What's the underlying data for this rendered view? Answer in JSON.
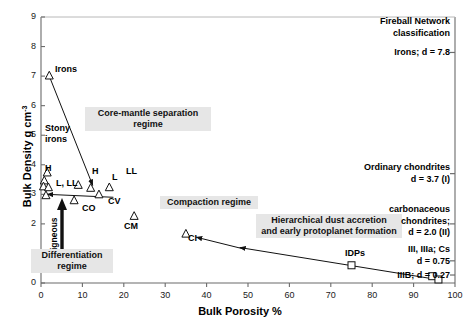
{
  "chart_data": {
    "type": "scatter",
    "title": "",
    "xlabel": "Bulk Porosity %",
    "ylabel": "Bulk Density g cm⁻³",
    "xlim": [
      0,
      100
    ],
    "ylim": [
      0,
      9
    ],
    "xticks": [
      0,
      10,
      20,
      30,
      40,
      50,
      60,
      70,
      80,
      90,
      100
    ],
    "yticks": [
      0,
      1,
      2,
      3,
      4,
      5,
      6,
      7,
      8,
      9
    ],
    "grid": false,
    "legend": "none",
    "series": [
      {
        "name": "Meteorite groups",
        "marker": "open-triangle",
        "points": [
          {
            "label": "Irons",
            "x": 2.0,
            "y": 7.0
          },
          {
            "label": "H",
            "x": 1.5,
            "y": 3.72
          },
          {
            "label": "",
            "x": 0.8,
            "y": 3.45
          },
          {
            "label": "L, LL",
            "x": 0.6,
            "y": 3.25
          },
          {
            "label": "",
            "x": 1.8,
            "y": 3.22
          },
          {
            "label": "H",
            "x": 9.0,
            "y": 3.3
          },
          {
            "label": "L",
            "x": 12.0,
            "y": 3.2
          },
          {
            "label": "LL",
            "x": 16.5,
            "y": 3.22
          },
          {
            "label": "",
            "x": 1.2,
            "y": 2.95
          },
          {
            "label": "CO",
            "x": 8.0,
            "y": 2.78
          },
          {
            "label": "CV",
            "x": 14.0,
            "y": 2.98
          },
          {
            "label": "CM",
            "x": 22.5,
            "y": 2.25
          },
          {
            "label": "CI",
            "x": 35.0,
            "y": 1.65
          }
        ]
      },
      {
        "name": "Dust / fluffy aggregates",
        "marker": "open-square",
        "points": [
          {
            "label": "IDPs",
            "x": 75.0,
            "y": 0.6
          },
          {
            "label": "",
            "x": 94.5,
            "y": 0.23
          },
          {
            "label": "",
            "x": 96.0,
            "y": 0.12
          }
        ]
      }
    ],
    "trend_arrows": [
      {
        "name": "core-mantle-arrow",
        "from": [
          2.0,
          7.0
        ],
        "to": [
          12.5,
          3.3
        ]
      },
      {
        "name": "differentiation-arrow",
        "from": [
          17.5,
          2.9
        ],
        "to": [
          1.5,
          3.0
        ]
      },
      {
        "name": "compaction-arrow",
        "from": [
          49.0,
          1.15
        ],
        "to": [
          37.5,
          1.55
        ]
      },
      {
        "name": "accretion-arrow",
        "from": [
          96.5,
          0.1
        ],
        "to": [
          48.0,
          1.2
        ]
      }
    ],
    "region_labels": [
      {
        "name": "core-mantle-separation",
        "text": "Core-mantle separation\nregime",
        "x": 30,
        "y": 5.3
      },
      {
        "name": "compaction-regime",
        "text": "Compaction regime",
        "x": 42,
        "y": 2.6
      },
      {
        "name": "differentiation-regime",
        "text": "Differentiation\nregime",
        "x": 7,
        "y": 1.1
      },
      {
        "name": "hierarchical-accretion",
        "text": "Hierarchical dust accretion\nand early protoplanet formation",
        "x": 70,
        "y": 1.55
      }
    ],
    "vertical_label": "igneous",
    "right_annotations": [
      {
        "name": "fireball-network-heading",
        "lines": [
          "Fireball Network",
          "classification"
        ],
        "y": 8.55
      },
      {
        "name": "irons-d",
        "lines": [
          "Irons; d = 7.8"
        ],
        "y": 7.8,
        "d": 7.8,
        "tick": true
      },
      {
        "name": "ordinary-chondrites-d",
        "lines": [
          "Ordinary chondrites",
          "d = 3.7 (I)"
        ],
        "y": 3.7,
        "d": 3.7,
        "tick": true
      },
      {
        "name": "carbonaceous-chondrites-d",
        "lines": [
          "carbonaceous",
          "chondrites;",
          "d = 2.0 (II)"
        ],
        "y": 2.0,
        "d": 2.0,
        "tick": true
      },
      {
        "name": "iii-iiia-cs-d",
        "lines": [
          "III, IIIa; Cs",
          "d = 0.75"
        ],
        "y": 0.75,
        "d": 0.75,
        "tick": true
      },
      {
        "name": "iiib-d",
        "lines": [
          "IIIB; d = 0.27"
        ],
        "y": 0.27,
        "d": 0.27,
        "tick": true
      }
    ]
  },
  "axis": {
    "xlabel": "Bulk Porosity %",
    "ylabel": "Bulk Density g cm",
    "ylabel_exp": "-3"
  },
  "labels": {
    "irons": "Irons",
    "stony_irons_1": "Stony",
    "stony_irons_2": "irons",
    "h1": "H",
    "h2": "H",
    "l_ll": "L, LL",
    "l": "L",
    "ll": "LL",
    "co": "CO",
    "cv": "CV",
    "cm": "CM",
    "ci": "CI",
    "idps": "IDPs",
    "igneous": "igneous"
  },
  "regions": {
    "core_mantle_a": "Core-mantle separation",
    "core_mantle_b": "regime",
    "compaction": "Compaction regime",
    "differentiation_a": "Differentiation",
    "differentiation_b": "regime",
    "hierarchical_a": "Hierarchical dust accretion",
    "hierarchical_b": "and early protoplanet formation"
  },
  "annotations": {
    "fireball_a": "Fireball Network",
    "fireball_b": "classification",
    "irons_d": "Irons; d = 7.8",
    "ord_a": "Ordinary chondrites",
    "ord_b": "d = 3.7 (I)",
    "carb_a": "carbonaceous",
    "carb_b": "chondrites;",
    "carb_c": "d = 2.0 (II)",
    "iii_a": "III, IIIa; Cs",
    "iii_b": "d = 0.75",
    "iiib": "IIIB; d = 0.27"
  },
  "colors": {
    "axis": "#6b6b6b",
    "marker": "#111111",
    "region_bg": "#e6e6e6",
    "text": "#000000"
  }
}
